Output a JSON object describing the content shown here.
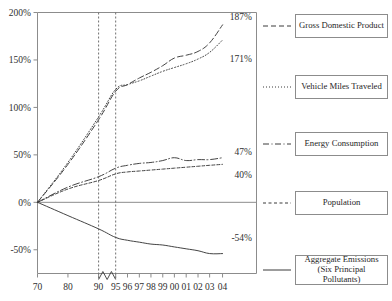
{
  "chart_data": {
    "type": "line",
    "title": "",
    "xlabel": "",
    "ylabel": "",
    "ylim": [
      -75,
      200
    ],
    "yticks": [
      "-50%",
      "0%",
      "50%",
      "100%",
      "150%",
      "200%"
    ],
    "ytick_values": [
      -50,
      0,
      50,
      100,
      150,
      200
    ],
    "xticks": [
      "70",
      "80",
      "90",
      "95",
      "96",
      "97",
      "98",
      "99",
      "00",
      "01",
      "02",
      "03",
      "04"
    ],
    "x": [
      1970,
      1980,
      1990,
      1995,
      1996,
      1997,
      1998,
      1999,
      2000,
      2001,
      2002,
      2003,
      2004
    ],
    "grid": false,
    "legend_position": "right",
    "axis_break_between": [
      "90",
      "95"
    ],
    "reference_lines": [
      "90",
      "95"
    ],
    "zero_line": true,
    "series": [
      {
        "name": "Gross Domestic Product",
        "style": "dashed",
        "end_label": "187%",
        "values": [
          0,
          40,
          87,
          117,
          124,
          131,
          137,
          144,
          152,
          155,
          159,
          168,
          187
        ]
      },
      {
        "name": "Vehicle Miles Traveled",
        "style": "dotted",
        "end_label": "171%",
        "values": [
          0,
          42,
          90,
          119,
          124,
          128,
          133,
          138,
          142,
          146,
          151,
          158,
          171
        ]
      },
      {
        "name": "Energy Consumption",
        "style": "dash-dot",
        "end_label": "47%",
        "values": [
          0,
          16,
          27,
          36,
          39,
          41,
          42,
          44,
          47,
          44,
          45,
          45,
          47
        ]
      },
      {
        "name": "Population",
        "style": "short-dashed",
        "end_label": "40%",
        "values": [
          0,
          14,
          23,
          30,
          32,
          33,
          34,
          35,
          36,
          37,
          38,
          39,
          40
        ]
      },
      {
        "name": "Aggregate Emissions (Six Principal Pollutants)",
        "style": "solid",
        "end_label": "-54%",
        "values": [
          0,
          -14,
          -28,
          -37,
          -40,
          -42,
          -44,
          -45,
          -47,
          -49,
          -51,
          -54,
          -54
        ]
      }
    ]
  },
  "legend": {
    "items": [
      {
        "label": "Gross Domestic Product",
        "label2": ""
      },
      {
        "label": "Vehicle Miles Traveled",
        "label2": ""
      },
      {
        "label": "Energy Consumption",
        "label2": ""
      },
      {
        "label": "Population",
        "label2": ""
      },
      {
        "label": "Aggregate Emissions",
        "label2": "(Six Principal Pollutants)"
      }
    ]
  },
  "colors": {
    "axis": "#8c8c8c",
    "line": "#3a3a3a",
    "reference": "#707070",
    "text": "#2b2b2b"
  }
}
